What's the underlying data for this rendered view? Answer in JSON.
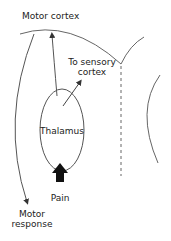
{
  "labels": {
    "motor_cortex": "Motor cortex",
    "to_sensory_1": "To sensory",
    "to_sensory_2": "cortex",
    "thalamus": "Thalamus",
    "pain": "Pain",
    "motor_response_1": "Motor",
    "motor_response_2": "response"
  },
  "colors": {
    "line": "#555555",
    "text": "#222222",
    "pain_arrow": "#111111",
    "background": "#ffffff"
  }
}
